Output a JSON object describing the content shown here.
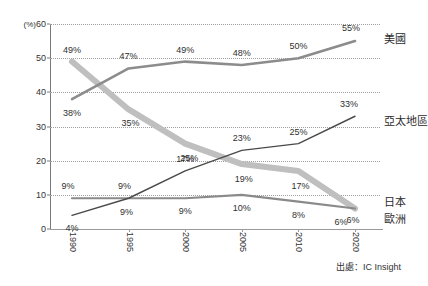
{
  "chart_data": {
    "type": "line",
    "title": "",
    "xlabel": "",
    "ylabel": "(%)",
    "unit_label": "(%)",
    "categories": [
      "1990",
      "1995",
      "2000",
      "2005",
      "2010",
      "2020"
    ],
    "ylim": [
      0,
      60
    ],
    "yticks": [
      0,
      10,
      20,
      30,
      40,
      50,
      60
    ],
    "ytick_labels": [
      "0",
      "10",
      "20",
      "30",
      "40",
      "50",
      "60"
    ],
    "grid": true,
    "grid_style": "dotted",
    "legend_position": "right-inline",
    "source": "出處：IC Insight",
    "series": [
      {
        "name": "美國",
        "color": "#8c8c8c",
        "width": 2.6,
        "values": [
          38,
          47,
          49,
          48,
          50,
          55
        ],
        "labels": [
          "38%",
          "47%",
          "49%",
          "48%",
          "50%",
          "55%"
        ]
      },
      {
        "name": "日本",
        "color": "#bfbfbf",
        "width": 6.0,
        "values": [
          49,
          35,
          25,
          19,
          17,
          6
        ],
        "labels": [
          "49%",
          "35%",
          "25%",
          "19%",
          "17%",
          "6%"
        ]
      },
      {
        "name": "亞太地區",
        "color": "#4a4a4a",
        "width": 1.4,
        "values": [
          4,
          9,
          17,
          23,
          25,
          33
        ],
        "labels": [
          "4%",
          "9%",
          "17%",
          "23%",
          "25%",
          "33%"
        ]
      },
      {
        "name": "歐洲",
        "color": "#8a8a8a",
        "width": 2.2,
        "values": [
          9,
          9,
          9,
          10,
          8,
          6
        ],
        "labels": [
          "9%",
          "9%",
          "9%",
          "10%",
          "8%",
          "6%"
        ]
      }
    ],
    "series_end_labels": [
      {
        "name": "美國",
        "value_label": "55%"
      },
      {
        "name": "亞太地區",
        "value_label": "33%"
      },
      {
        "name": "日本",
        "value_label": "6%"
      },
      {
        "name": "歐洲",
        "value_label": "6%"
      }
    ]
  }
}
